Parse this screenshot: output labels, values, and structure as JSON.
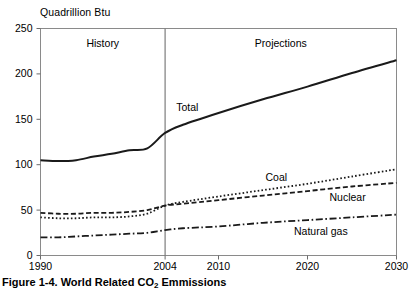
{
  "caption": {
    "prefix": "Figure 1-4.  World Related CO",
    "subscript": "2",
    "suffix": " Emmissions"
  },
  "chart_data": {
    "type": "line",
    "title": "",
    "unit_label": "Quadrillion Btu",
    "xlabel": "",
    "ylabel": "Quadrillion Btu",
    "xlim": [
      1990,
      2030
    ],
    "ylim": [
      0,
      250
    ],
    "grid": false,
    "legend_position": "inline-annotations",
    "yticks": [
      0,
      50,
      100,
      150,
      200,
      250
    ],
    "ytick_labels": [
      "0",
      "50",
      "100",
      "150",
      "200",
      "250"
    ],
    "xticks": [
      1990,
      2004,
      2010,
      2020,
      2030
    ],
    "xtick_labels": [
      "1990",
      "2004",
      "2010",
      "2020",
      "2030"
    ],
    "divider_x": 2004,
    "region_labels": [
      {
        "text": "History",
        "x": 1997
      },
      {
        "text": "Projections",
        "x": 2017
      }
    ],
    "annotations": [
      {
        "text": "Total",
        "x": 2006.5,
        "y": 163
      },
      {
        "text": "Coal",
        "x": 2016.5,
        "y": 86
      },
      {
        "text": "Nuclear",
        "x": 2024.5,
        "y": 64
      },
      {
        "text": "Natural gas",
        "x": 2021.5,
        "y": 27
      }
    ],
    "x": [
      1990,
      1992,
      1994,
      1996,
      1998,
      2000,
      2002,
      2004,
      2006,
      2010,
      2015,
      2020,
      2025,
      2030
    ],
    "series": [
      {
        "name": "Total",
        "style": "solid",
        "color": "#1a1a1a",
        "values": [
          105,
          104,
          105,
          109,
          112,
          116,
          118,
          135,
          144,
          157,
          172,
          186,
          201,
          215
        ]
      },
      {
        "name": "Nuclear",
        "style": "dashed",
        "color": "#1a1a1a",
        "values": [
          47,
          46,
          46,
          47,
          47,
          48,
          50,
          55,
          57,
          61,
          66,
          71,
          76,
          80
        ]
      },
      {
        "name": "Coal",
        "style": "dotted",
        "color": "#1a1a1a",
        "values": [
          42,
          41,
          41,
          42,
          42,
          43,
          46,
          55,
          59,
          65,
          72,
          79,
          87,
          95
        ]
      },
      {
        "name": "Natural gas",
        "style": "dash-dot",
        "color": "#1a1a1a",
        "values": [
          20,
          20,
          21,
          22,
          23,
          24,
          25,
          28,
          30,
          32,
          36,
          39,
          42,
          45
        ]
      }
    ]
  }
}
